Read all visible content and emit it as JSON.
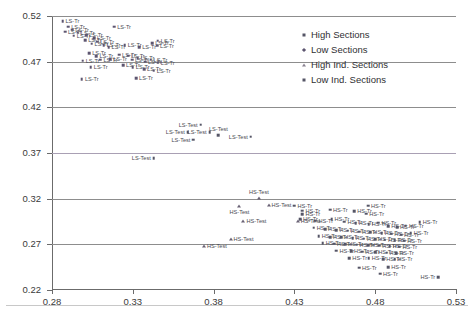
{
  "chart_data": {
    "type": "scatter",
    "title": "",
    "xlabel": "",
    "ylabel": "",
    "xlim": [
      0.28,
      0.53
    ],
    "ylim": [
      0.22,
      0.52
    ],
    "xticks": [
      "0.28",
      "0.33",
      "0.38",
      "0.43",
      "0.48",
      "0.53"
    ],
    "yticks": [
      "0.52",
      "0.47",
      "0.42",
      "0.37",
      "0.32",
      "0.27",
      "0.22"
    ],
    "grid": true,
    "legend_position": "top-right",
    "legend": [
      {
        "label": "High Sections",
        "marker": "square"
      },
      {
        "label": "Low Sections",
        "marker": "diamond"
      },
      {
        "label": "High Ind. Sections",
        "marker": "triangle"
      },
      {
        "label": "Low Ind. Sections",
        "marker": "square"
      }
    ],
    "series": [
      {
        "name": "LS-Tr",
        "marker": "diamond",
        "label": "LS-Tr",
        "points": [
          {
            "x": 0.2865,
            "y": 0.5145,
            "lab": "right"
          },
          {
            "x": 0.29,
            "y": 0.5085,
            "lab": "right"
          },
          {
            "x": 0.2925,
            "y": 0.505,
            "lab": "right"
          },
          {
            "x": 0.288,
            "y": 0.503,
            "lab": "right"
          },
          {
            "x": 0.296,
            "y": 0.5015,
            "lab": "right"
          },
          {
            "x": 0.2935,
            "y": 0.4985,
            "lab": "right"
          },
          {
            "x": 0.301,
            "y": 0.499,
            "lab": "right"
          },
          {
            "x": 0.306,
            "y": 0.496,
            "lab": "right"
          },
          {
            "x": 0.3005,
            "y": 0.4935,
            "lab": "right"
          },
          {
            "x": 0.308,
            "y": 0.492,
            "lab": "right"
          },
          {
            "x": 0.3045,
            "y": 0.4895,
            "lab": "right"
          },
          {
            "x": 0.312,
            "y": 0.488,
            "lab": "right"
          },
          {
            "x": 0.315,
            "y": 0.486,
            "lab": "right"
          },
          {
            "x": 0.3185,
            "y": 0.5085,
            "lab": "right"
          },
          {
            "x": 0.325,
            "y": 0.488,
            "lab": "right"
          },
          {
            "x": 0.334,
            "y": 0.486,
            "lab": "right"
          },
          {
            "x": 0.342,
            "y": 0.4905,
            "lab": "right"
          },
          {
            "x": 0.3455,
            "y": 0.493,
            "lab": "right"
          },
          {
            "x": 0.345,
            "y": 0.4875,
            "lab": "right"
          },
          {
            "x": 0.303,
            "y": 0.479,
            "lab": "right"
          },
          {
            "x": 0.3075,
            "y": 0.476,
            "lab": "right"
          },
          {
            "x": 0.299,
            "y": 0.471,
            "lab": "right"
          },
          {
            "x": 0.31,
            "y": 0.472,
            "lab": "right"
          },
          {
            "x": 0.316,
            "y": 0.4725,
            "lab": "right"
          },
          {
            "x": 0.3215,
            "y": 0.4775,
            "lab": "right"
          },
          {
            "x": 0.327,
            "y": 0.4765,
            "lab": "right"
          },
          {
            "x": 0.3295,
            "y": 0.472,
            "lab": "right"
          },
          {
            "x": 0.333,
            "y": 0.4735,
            "lab": "right"
          },
          {
            "x": 0.3375,
            "y": 0.47,
            "lab": "right"
          },
          {
            "x": 0.341,
            "y": 0.472,
            "lab": "right"
          },
          {
            "x": 0.3455,
            "y": 0.469,
            "lab": "right"
          },
          {
            "x": 0.304,
            "y": 0.464,
            "lab": "right"
          },
          {
            "x": 0.324,
            "y": 0.466,
            "lab": "right"
          },
          {
            "x": 0.33,
            "y": 0.464,
            "lab": "right"
          },
          {
            "x": 0.337,
            "y": 0.462,
            "lab": "right"
          },
          {
            "x": 0.343,
            "y": 0.46,
            "lab": "right"
          },
          {
            "x": 0.2985,
            "y": 0.451,
            "lab": "right"
          },
          {
            "x": 0.332,
            "y": 0.452,
            "lab": "right"
          }
        ]
      },
      {
        "name": "LS-Test",
        "marker": "square",
        "label": "LS-Test",
        "points": [
          {
            "x": 0.372,
            "y": 0.401,
            "lab": "left"
          },
          {
            "x": 0.364,
            "y": 0.393,
            "lab": "left"
          },
          {
            "x": 0.3775,
            "y": 0.393,
            "lab": "left"
          },
          {
            "x": 0.383,
            "y": 0.3895,
            "lab": "above"
          },
          {
            "x": 0.3675,
            "y": 0.3845,
            "lab": "left"
          },
          {
            "x": 0.403,
            "y": 0.388,
            "lab": "left"
          },
          {
            "x": 0.343,
            "y": 0.3645,
            "lab": "left"
          }
        ]
      },
      {
        "name": "HS-Test",
        "marker": "triangle",
        "label": "HS-Test",
        "points": [
          {
            "x": 0.408,
            "y": 0.321,
            "lab": "above"
          },
          {
            "x": 0.396,
            "y": 0.3125,
            "lab": "below"
          },
          {
            "x": 0.414,
            "y": 0.3135,
            "lab": "right"
          },
          {
            "x": 0.3985,
            "y": 0.2955,
            "lab": "right"
          },
          {
            "x": 0.432,
            "y": 0.296,
            "lab": "right"
          },
          {
            "x": 0.3905,
            "y": 0.276,
            "lab": "right"
          },
          {
            "x": 0.374,
            "y": 0.268,
            "lab": "right"
          }
        ]
      },
      {
        "name": "HS-Tr",
        "marker": "square",
        "label": "HS-Tr",
        "points": [
          {
            "x": 0.452,
            "y": 0.308,
            "lab": "right"
          },
          {
            "x": 0.4755,
            "y": 0.3125,
            "lab": "right"
          },
          {
            "x": 0.467,
            "y": 0.306,
            "lab": "right"
          },
          {
            "x": 0.4745,
            "y": 0.3035,
            "lab": "right"
          },
          {
            "x": 0.435,
            "y": 0.307,
            "lab": "right"
          },
          {
            "x": 0.435,
            "y": 0.303,
            "lab": "right"
          },
          {
            "x": 0.443,
            "y": 0.296,
            "lab": "right"
          },
          {
            "x": 0.453,
            "y": 0.2975,
            "lab": "right"
          },
          {
            "x": 0.461,
            "y": 0.295,
            "lab": "right"
          },
          {
            "x": 0.468,
            "y": 0.293,
            "lab": "right"
          },
          {
            "x": 0.476,
            "y": 0.292,
            "lab": "right"
          },
          {
            "x": 0.482,
            "y": 0.2935,
            "lab": "right"
          },
          {
            "x": 0.488,
            "y": 0.29,
            "lab": "right"
          },
          {
            "x": 0.4935,
            "y": 0.2885,
            "lab": "right"
          },
          {
            "x": 0.499,
            "y": 0.2905,
            "lab": "right"
          },
          {
            "x": 0.442,
            "y": 0.288,
            "lab": "right"
          },
          {
            "x": 0.449,
            "y": 0.2865,
            "lab": "right"
          },
          {
            "x": 0.456,
            "y": 0.2855,
            "lab": "right"
          },
          {
            "x": 0.463,
            "y": 0.285,
            "lab": "right"
          },
          {
            "x": 0.47,
            "y": 0.284,
            "lab": "right"
          },
          {
            "x": 0.477,
            "y": 0.2835,
            "lab": "right"
          },
          {
            "x": 0.484,
            "y": 0.2825,
            "lab": "right"
          },
          {
            "x": 0.49,
            "y": 0.2815,
            "lab": "right"
          },
          {
            "x": 0.496,
            "y": 0.2805,
            "lab": "right"
          },
          {
            "x": 0.502,
            "y": 0.2825,
            "lab": "right"
          },
          {
            "x": 0.445,
            "y": 0.279,
            "lab": "right"
          },
          {
            "x": 0.452,
            "y": 0.278,
            "lab": "right"
          },
          {
            "x": 0.459,
            "y": 0.2775,
            "lab": "right"
          },
          {
            "x": 0.466,
            "y": 0.277,
            "lab": "right"
          },
          {
            "x": 0.473,
            "y": 0.276,
            "lab": "right"
          },
          {
            "x": 0.48,
            "y": 0.2755,
            "lab": "right"
          },
          {
            "x": 0.486,
            "y": 0.275,
            "lab": "right"
          },
          {
            "x": 0.492,
            "y": 0.2745,
            "lab": "right"
          },
          {
            "x": 0.498,
            "y": 0.274,
            "lab": "right"
          },
          {
            "x": 0.4475,
            "y": 0.271,
            "lab": "right"
          },
          {
            "x": 0.4545,
            "y": 0.2705,
            "lab": "right"
          },
          {
            "x": 0.4615,
            "y": 0.27,
            "lab": "right"
          },
          {
            "x": 0.4685,
            "y": 0.2695,
            "lab": "right"
          },
          {
            "x": 0.4755,
            "y": 0.269,
            "lab": "right"
          },
          {
            "x": 0.4825,
            "y": 0.2685,
            "lab": "right"
          },
          {
            "x": 0.489,
            "y": 0.268,
            "lab": "right"
          },
          {
            "x": 0.495,
            "y": 0.2675,
            "lab": "right"
          },
          {
            "x": 0.456,
            "y": 0.263,
            "lab": "right"
          },
          {
            "x": 0.465,
            "y": 0.2625,
            "lab": "right"
          },
          {
            "x": 0.472,
            "y": 0.262,
            "lab": "right"
          },
          {
            "x": 0.48,
            "y": 0.2615,
            "lab": "right"
          },
          {
            "x": 0.487,
            "y": 0.261,
            "lab": "right"
          },
          {
            "x": 0.493,
            "y": 0.2605,
            "lab": "right"
          },
          {
            "x": 0.464,
            "y": 0.2545,
            "lab": "right"
          },
          {
            "x": 0.476,
            "y": 0.255,
            "lab": "right"
          },
          {
            "x": 0.485,
            "y": 0.254,
            "lab": "right"
          },
          {
            "x": 0.492,
            "y": 0.2535,
            "lab": "right"
          },
          {
            "x": 0.47,
            "y": 0.2445,
            "lab": "right"
          },
          {
            "x": 0.488,
            "y": 0.245,
            "lab": "right"
          },
          {
            "x": 0.483,
            "y": 0.238,
            "lab": "right"
          },
          {
            "x": 0.519,
            "y": 0.234,
            "lab": "left"
          },
          {
            "x": 0.4335,
            "y": 0.2975,
            "lab": "right"
          },
          {
            "x": 0.43,
            "y": 0.3125,
            "lab": "right"
          },
          {
            "x": 0.5075,
            "y": 0.294,
            "lab": "right"
          }
        ]
      }
    ]
  }
}
